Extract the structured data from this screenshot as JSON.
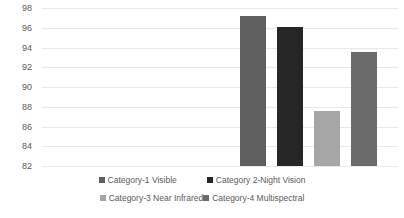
{
  "chart_data": {
    "type": "bar",
    "title": "",
    "xlabel": "",
    "ylabel": "",
    "categories": [
      "Category-1 Visible",
      "Category 2-Night Vision",
      "Category-3 Near Infrared",
      "Category-4 Multispectral"
    ],
    "values": [
      97.2,
      96.1,
      87.6,
      93.5
    ],
    "colors": [
      "#5f5f5f",
      "#262626",
      "#a6a6a6",
      "#6b6b6b"
    ],
    "ylim": [
      82,
      98
    ],
    "yticks": [
      82,
      84,
      86,
      88,
      90,
      92,
      94,
      96,
      98
    ],
    "ytick_labels": [
      "82",
      "84",
      "86",
      "88",
      "90",
      "92",
      "94",
      "96",
      "98"
    ],
    "grid": true,
    "grid_color": "#e8e8e8",
    "legend_position": "bottom",
    "legend": [
      {
        "label": "Category-1 Visible",
        "color": "#5f5f5f"
      },
      {
        "label": "Category 2-Night Vision",
        "color": "#262626"
      },
      {
        "label": "Category-3 Near Infrared",
        "color": "#a6a6a6"
      },
      {
        "label": "Category-4 Multispectral",
        "color": "#6b6b6b"
      }
    ]
  }
}
